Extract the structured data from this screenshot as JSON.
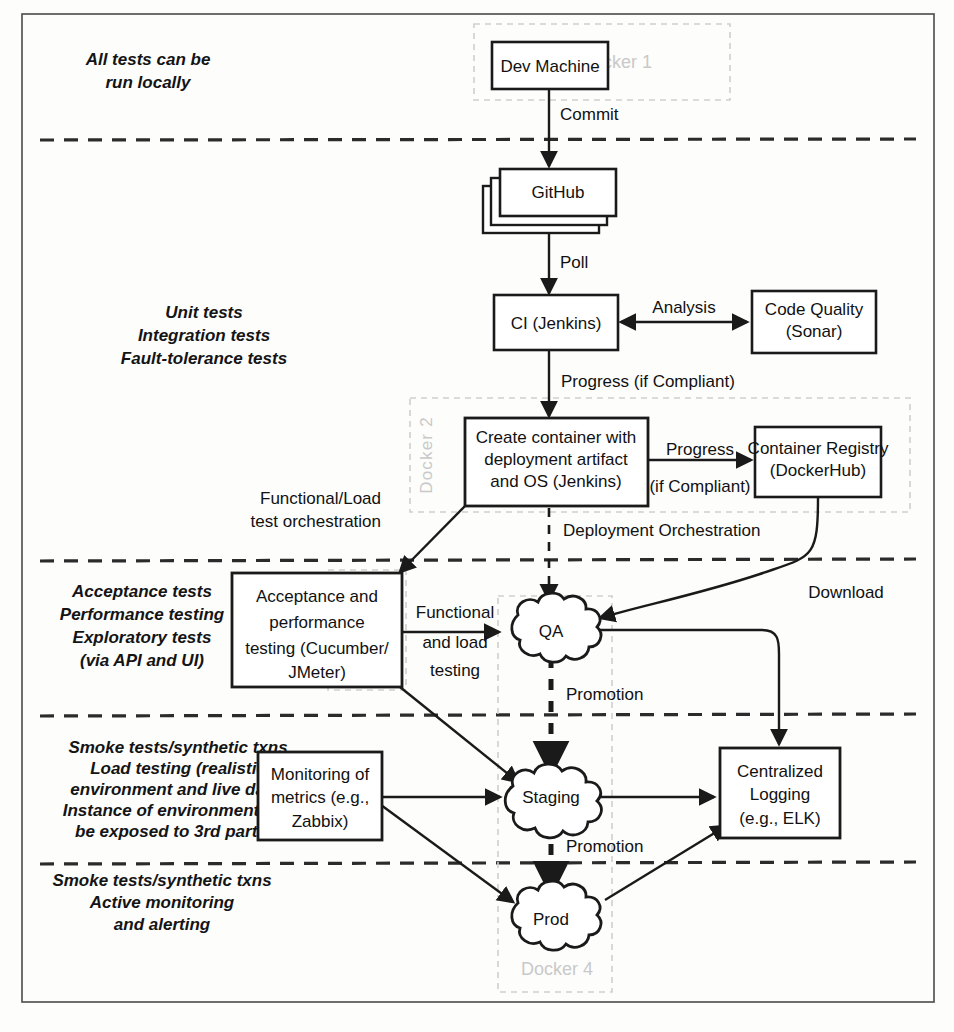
{
  "diagram": {
    "type": "flowchart",
    "colors": {
      "background": "#fdfdfc",
      "stroke": "#1a1a1a",
      "docker_label": "#c9c9c9",
      "docker_border": "#cfcfcf",
      "node_fill": "#ffffff"
    }
  },
  "lane_notes": [
    {
      "id": "lane-note-local",
      "lines": [
        "All tests can be",
        "run locally"
      ]
    },
    {
      "id": "lane-note-ci",
      "lines": [
        "Unit tests",
        "Integration tests",
        "Fault-tolerance tests"
      ]
    },
    {
      "id": "lane-note-acceptance",
      "lines": [
        "Acceptance tests",
        "Performance testing",
        "Exploratory tests",
        "(via API and UI)"
      ]
    },
    {
      "id": "lane-note-staging",
      "lines": [
        "Smoke tests/synthetic txns",
        "Load testing (realistic",
        "environment and live data)",
        "Instance of environment can",
        "be exposed to 3rd parties"
      ]
    },
    {
      "id": "lane-note-prod",
      "lines": [
        "Smoke tests/synthetic txns",
        "Active monitoring",
        "and alerting"
      ]
    }
  ],
  "docker_regions": [
    {
      "id": "docker-1",
      "label": "Docker 1",
      "orientation": "horizontal"
    },
    {
      "id": "docker-2",
      "label": "Docker 2",
      "orientation": "vertical"
    },
    {
      "id": "docker-3",
      "label": "Docker 3",
      "orientation": "vertical"
    },
    {
      "id": "docker-4",
      "label": "Docker 4",
      "orientation": "horizontal"
    }
  ],
  "nodes": [
    {
      "id": "dev-machine",
      "shape": "box",
      "lines": [
        "Dev Machine"
      ]
    },
    {
      "id": "github",
      "shape": "stacked-box",
      "lines": [
        "GitHub"
      ]
    },
    {
      "id": "ci-jenkins",
      "shape": "box",
      "lines": [
        "CI (Jenkins)"
      ]
    },
    {
      "id": "code-quality",
      "shape": "box",
      "lines": [
        "Code Quality",
        "(Sonar)"
      ]
    },
    {
      "id": "create-container",
      "shape": "box",
      "lines": [
        "Create container with",
        "deployment artifact",
        "and OS (Jenkins)"
      ]
    },
    {
      "id": "container-registry",
      "shape": "box",
      "lines": [
        "Container Registry",
        "(DockerHub)"
      ]
    },
    {
      "id": "acceptance-testing",
      "shape": "box",
      "lines": [
        "Acceptance and",
        "performance",
        "testing (Cucumber/",
        "JMeter)"
      ]
    },
    {
      "id": "monitoring-metrics",
      "shape": "box",
      "lines": [
        "Monitoring of",
        "metrics (e.g.,",
        "Zabbix)"
      ]
    },
    {
      "id": "centralized-logging",
      "shape": "box",
      "lines": [
        "Centralized",
        "Logging",
        "(e.g., ELK)"
      ]
    },
    {
      "id": "qa-env",
      "shape": "cloud",
      "lines": [
        "QA"
      ]
    },
    {
      "id": "staging-env",
      "shape": "cloud",
      "lines": [
        "Staging"
      ]
    },
    {
      "id": "prod-env",
      "shape": "cloud",
      "lines": [
        "Prod"
      ]
    }
  ],
  "edges": [
    {
      "id": "edge-commit",
      "from": "dev-machine",
      "to": "github",
      "label_lines": [
        "Commit"
      ],
      "style": "solid"
    },
    {
      "id": "edge-poll",
      "from": "github",
      "to": "ci-jenkins",
      "label_lines": [
        "Poll"
      ],
      "style": "solid"
    },
    {
      "id": "edge-analysis",
      "from": "ci-jenkins",
      "to": "code-quality",
      "label_lines": [
        "Analysis"
      ],
      "style": "solid-bidirectional"
    },
    {
      "id": "edge-progress-compliant",
      "from": "ci-jenkins",
      "to": "create-container",
      "label_lines": [
        "Progress (if Compliant)"
      ],
      "style": "solid"
    },
    {
      "id": "edge-progress-registry",
      "from": "create-container",
      "to": "container-registry",
      "label_lines": [
        "Progress",
        "(if Compliant)"
      ],
      "style": "solid"
    },
    {
      "id": "edge-functional-load-orchestration",
      "from": "create-container",
      "to": "acceptance-testing",
      "label_lines": [
        "Functional/Load",
        "test orchestration"
      ],
      "style": "solid"
    },
    {
      "id": "edge-deployment-orchestration",
      "from": "create-container",
      "to": "qa-env",
      "label_lines": [
        "Deployment Orchestration"
      ],
      "style": "dashed"
    },
    {
      "id": "edge-download",
      "from": "container-registry",
      "to": "qa-env",
      "label_lines": [
        "Download"
      ],
      "style": "solid"
    },
    {
      "id": "edge-functional-load-testing",
      "from": "acceptance-testing",
      "to": "qa-env",
      "label_lines": [
        "Functional",
        "and load",
        "testing"
      ],
      "style": "solid"
    },
    {
      "id": "edge-qa-logging",
      "from": "qa-env",
      "to": "centralized-logging",
      "style": "solid"
    },
    {
      "id": "edge-promotion-qa-staging",
      "from": "qa-env",
      "to": "staging-env",
      "label_lines": [
        "Promotion"
      ],
      "style": "dashed-thick"
    },
    {
      "id": "edge-acceptance-staging",
      "from": "acceptance-testing",
      "to": "staging-env",
      "style": "solid"
    },
    {
      "id": "edge-monitoring-staging",
      "from": "monitoring-metrics",
      "to": "staging-env",
      "style": "solid"
    },
    {
      "id": "edge-staging-logging",
      "from": "staging-env",
      "to": "centralized-logging",
      "style": "solid"
    },
    {
      "id": "edge-promotion-staging-prod",
      "from": "staging-env",
      "to": "prod-env",
      "label_lines": [
        "Promotion"
      ],
      "style": "dashed-thick"
    },
    {
      "id": "edge-monitoring-prod",
      "from": "monitoring-metrics",
      "to": "prod-env",
      "style": "solid"
    },
    {
      "id": "edge-prod-logging",
      "from": "prod-env",
      "to": "centralized-logging",
      "style": "solid"
    }
  ],
  "edge_labels": {
    "commit": "Commit",
    "poll": "Poll",
    "analysis": "Analysis",
    "progress_if_compliant": "Progress (if Compliant)",
    "progress": "Progress",
    "if_compliant": "(if Compliant)",
    "functional_load": "Functional/Load",
    "test_orchestration": "test orchestration",
    "deployment_orchestration": "Deployment Orchestration",
    "download": "Download",
    "functional": "Functional",
    "and_load": "and load",
    "testing": "testing",
    "promotion_qa": "Promotion",
    "promotion_staging": "Promotion"
  },
  "node_labels": {
    "dev_machine": "Dev Machine",
    "github": "GitHub",
    "ci_jenkins": "CI (Jenkins)",
    "code_quality_l1": "Code Quality",
    "code_quality_l2": "(Sonar)",
    "create_container_l1": "Create container with",
    "create_container_l2": "deployment artifact",
    "create_container_l3": "and OS (Jenkins)",
    "container_registry_l1": "Container Registry",
    "container_registry_l2": "(DockerHub)",
    "acceptance_l1": "Acceptance and",
    "acceptance_l2": "performance",
    "acceptance_l3": "testing (Cucumber/",
    "acceptance_l4": "JMeter)",
    "monitoring_l1": "Monitoring of",
    "monitoring_l2": "metrics (e.g.,",
    "monitoring_l3": "Zabbix)",
    "logging_l1": "Centralized",
    "logging_l2": "Logging",
    "logging_l3": "(e.g., ELK)",
    "qa": "QA",
    "staging": "Staging",
    "prod": "Prod"
  },
  "notes_text": {
    "local_1": "All tests can be",
    "local_2": "run locally",
    "ci_1": "Unit tests",
    "ci_2": "Integration tests",
    "ci_3": "Fault-tolerance tests",
    "acc_1": "Acceptance tests",
    "acc_2": "Performance testing",
    "acc_3": "Exploratory tests",
    "acc_4": "(via API and UI)",
    "stg_1": "Smoke tests/synthetic txns",
    "stg_2": "Load testing (realistic",
    "stg_3": "environment and live data)",
    "stg_4": "Instance of environment can",
    "stg_5": "be exposed to 3rd parties",
    "prd_1": "Smoke tests/synthetic txns",
    "prd_2": "Active monitoring",
    "prd_3": "and alerting"
  },
  "docker_text": {
    "d1": "Docker 1",
    "d2": "Docker 2",
    "d3": "Docker 3",
    "d4": "Docker 4"
  }
}
